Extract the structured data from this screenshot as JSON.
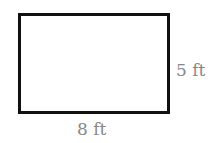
{
  "diagram": {
    "shape": "rectangle",
    "width_label": "8 ft",
    "height_label": "5 ft",
    "width_value": 8,
    "height_value": 5,
    "unit": "ft",
    "colors": {
      "stroke": "#111111",
      "fill": "#ffffff",
      "label": "#888888"
    }
  }
}
